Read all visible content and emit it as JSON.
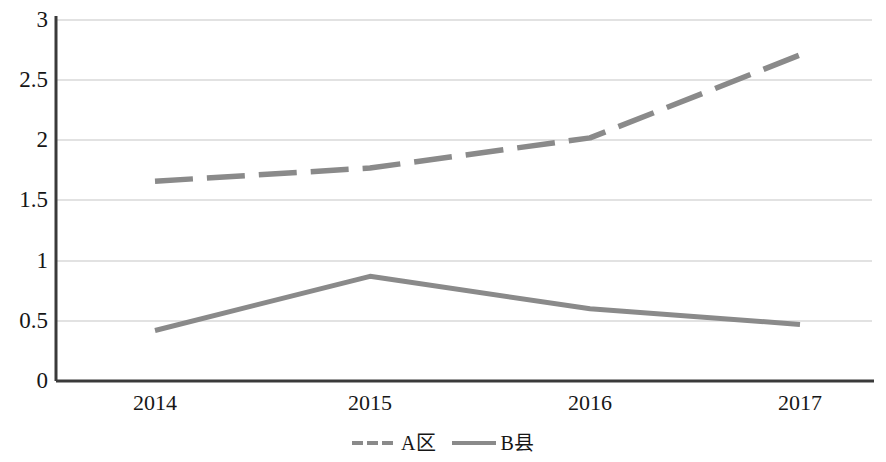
{
  "chart_data": {
    "type": "line",
    "title": "",
    "xlabel": "",
    "ylabel": "",
    "categories": [
      "2014",
      "2015",
      "2016",
      "2017"
    ],
    "series": [
      {
        "name": "A区",
        "values": [
          1.66,
          1.77,
          2.02,
          2.71
        ],
        "style": "dashed",
        "color": "#8a8a8a"
      },
      {
        "name": "B县",
        "values": [
          0.42,
          0.87,
          0.6,
          0.47
        ],
        "style": "solid",
        "color": "#8a8a8a"
      }
    ],
    "ylim": [
      0,
      3
    ],
    "ytick_labels": [
      "0",
      "0.5",
      "1",
      "1.5",
      "2",
      "2.5",
      "3"
    ],
    "ytick_values": [
      0,
      0.5,
      1,
      1.5,
      2,
      2.5,
      3
    ],
    "grid": true,
    "grid_color": "#d9d9d9",
    "legend_position": "bottom",
    "axis_color": "#3a3a3a"
  },
  "legend": {
    "items": [
      {
        "label": "A区",
        "style": "dashed"
      },
      {
        "label": "B县",
        "style": "solid"
      }
    ]
  }
}
